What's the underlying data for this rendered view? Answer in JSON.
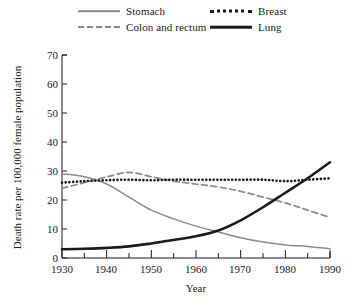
{
  "chart_data": {
    "type": "line",
    "title": "",
    "xlabel": "Year",
    "ylabel": "Death rate per 100,000 female population",
    "xlim": [
      1930,
      1990
    ],
    "ylim": [
      0,
      70
    ],
    "yticks": [
      0,
      10,
      20,
      30,
      40,
      50,
      60,
      70
    ],
    "xticks": [
      1930,
      1940,
      1950,
      1960,
      1970,
      1980,
      1990
    ],
    "xminor_step": 5,
    "grid": false,
    "legend_position": "above-plot",
    "series": [
      {
        "name": "Stomach",
        "style": "solid",
        "color": "#8a8a8a",
        "x": [
          1930,
          1935,
          1940,
          1945,
          1950,
          1955,
          1960,
          1965,
          1970,
          1975,
          1980,
          1985,
          1990
        ],
        "values": [
          29.0,
          28.0,
          25.5,
          21.0,
          16.5,
          13.5,
          11.0,
          9.0,
          7.0,
          5.5,
          4.5,
          4.0,
          3.2
        ]
      },
      {
        "name": "Colon and rectum",
        "style": "dashed",
        "color": "#8a8a8a",
        "x": [
          1930,
          1935,
          1940,
          1945,
          1950,
          1955,
          1960,
          1965,
          1970,
          1975,
          1980,
          1985,
          1990
        ],
        "values": [
          24.0,
          26.0,
          28.0,
          29.5,
          28.0,
          26.5,
          25.5,
          24.5,
          23.0,
          21.0,
          19.0,
          16.5,
          14.0
        ]
      },
      {
        "name": "Breast",
        "style": "dotted",
        "color": "#1a1a1a",
        "x": [
          1930,
          1935,
          1940,
          1945,
          1950,
          1955,
          1960,
          1965,
          1970,
          1975,
          1980,
          1985,
          1990
        ],
        "values": [
          26.0,
          26.5,
          26.8,
          27.0,
          26.8,
          27.0,
          27.0,
          27.0,
          27.0,
          27.0,
          26.5,
          27.0,
          27.5
        ]
      },
      {
        "name": "Lung",
        "style": "solid-bold",
        "color": "#1a1a1a",
        "x": [
          1930,
          1935,
          1940,
          1945,
          1950,
          1955,
          1960,
          1965,
          1970,
          1975,
          1980,
          1985,
          1990
        ],
        "values": [
          3.0,
          3.2,
          3.5,
          4.0,
          5.0,
          6.2,
          7.5,
          9.5,
          13.0,
          17.5,
          22.5,
          27.5,
          33.0
        ]
      }
    ]
  },
  "legend": {
    "items": [
      {
        "label": "Stomach",
        "swatch": "solid-gray-line"
      },
      {
        "label": "Colon and rectum",
        "swatch": "dashed-gray-line"
      },
      {
        "label": "Breast",
        "swatch": "dotted-black-line"
      },
      {
        "label": "Lung",
        "swatch": "solid-black-line"
      }
    ]
  },
  "axes": {
    "y_title": "Death rate per 100,000 female population",
    "x_title": "Year",
    "y_labels": [
      "70",
      "60",
      "50",
      "40",
      "30",
      "20",
      "10",
      "0"
    ],
    "x_labels": [
      "1930",
      "1940",
      "1950",
      "1960",
      "1970",
      "1980",
      "1990"
    ]
  },
  "colors": {
    "gray_series": "#8a8a8a",
    "black_series": "#1a1a1a",
    "axis": "#1a1a1a",
    "background": "#ffffff"
  }
}
